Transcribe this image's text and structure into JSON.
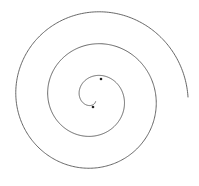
{
  "figure": {
    "type": "archimedean-spiral",
    "width": 199,
    "height": 186,
    "background": "#ffffff",
    "stroke_color": "#555555",
    "stroke_width": 0.9,
    "center": [
      94,
      98
    ],
    "start_radius": 4,
    "growth_per_turn": 32,
    "turns": 3.0,
    "start_angle_deg": 60,
    "direction": "clockwise-outward-in-screen",
    "markers": [
      {
        "name": "inner-tip-dot",
        "x": 93,
        "y": 107,
        "r": 1.3,
        "color": "#222222"
      },
      {
        "name": "inner-ring-dot",
        "x": 101,
        "y": 79,
        "r": 1.3,
        "color": "#222222"
      }
    ],
    "outer_end": [
      188,
      97
    ]
  }
}
